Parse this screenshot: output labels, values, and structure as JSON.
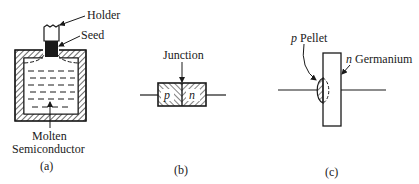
{
  "figure": {
    "panels": [
      {
        "id": "a",
        "caption": "(a)",
        "labels": {
          "holder": "Holder",
          "seed": "Seed",
          "molten_line1": "Molten",
          "molten_line2": "Semiconductor"
        }
      },
      {
        "id": "b",
        "caption": "(b)",
        "labels": {
          "junction": "Junction",
          "p_region": "p",
          "n_region": "n"
        }
      },
      {
        "id": "c",
        "caption": "(c)",
        "labels": {
          "pellet_prefix": "p",
          "pellet": "Pellet",
          "germanium_prefix": "n",
          "germanium": "Germanium"
        }
      }
    ]
  },
  "colors": {
    "ink": "#1a1a1a",
    "background": "#ffffff"
  }
}
